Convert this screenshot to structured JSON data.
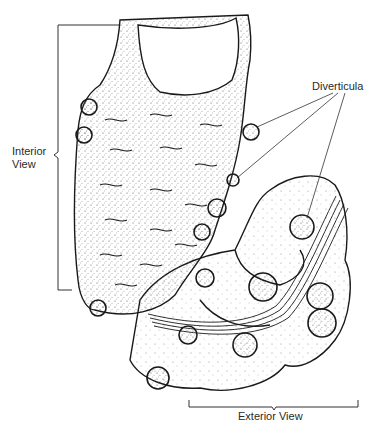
{
  "figure": {
    "labels": {
      "interior_view": [
        "Interior",
        "View"
      ],
      "diverticula": "Diverticula",
      "exterior_view": "Exterior View"
    },
    "caption_partial": "",
    "colors": {
      "ink": "#1a1a1a",
      "paper": "#ffffff",
      "stipple": "#555555"
    }
  }
}
